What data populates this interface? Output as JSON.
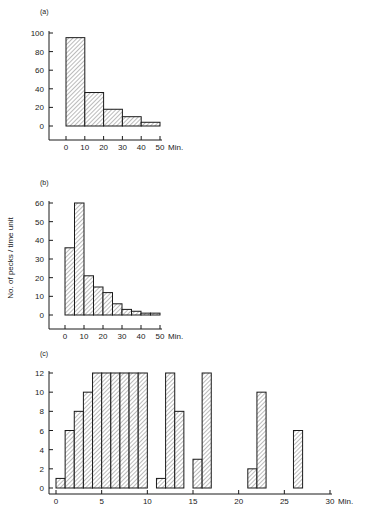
{
  "figure": {
    "shared_ylabel": "No. of pecks / time unit",
    "x_unit": "Min."
  },
  "chart_data": [
    {
      "panel": "(a)",
      "type": "bar",
      "bin_width": 10,
      "categories": [
        "0-10",
        "10-20",
        "20-30",
        "30-40",
        "40-50"
      ],
      "bin_starts": [
        0,
        10,
        20,
        30,
        40
      ],
      "values": [
        95,
        36,
        18,
        10,
        4
      ],
      "xticks": [
        "0",
        "10",
        "20",
        "30",
        "40",
        "50"
      ],
      "yticks": [
        "0",
        "20",
        "40",
        "60",
        "80",
        "100"
      ],
      "xlabel": "Min.",
      "ylabel": "",
      "xlim": [
        0,
        50
      ],
      "ylim": [
        0,
        100
      ],
      "grid": false
    },
    {
      "panel": "(b)",
      "type": "bar",
      "bin_width": 5,
      "categories": [
        "0-5",
        "5-10",
        "10-15",
        "15-20",
        "20-25",
        "25-30",
        "30-35",
        "35-40",
        "40-45",
        "45-50"
      ],
      "bin_starts": [
        0,
        5,
        10,
        15,
        20,
        25,
        30,
        35,
        40,
        45
      ],
      "values": [
        36,
        60,
        21,
        15,
        12,
        6,
        3,
        2,
        1,
        1
      ],
      "xticks": [
        "0",
        "10",
        "20",
        "30",
        "40",
        "50"
      ],
      "yticks": [
        "0",
        "10",
        "20",
        "30",
        "40",
        "50",
        "60"
      ],
      "xlabel": "Min.",
      "ylabel": "No. of pecks / time unit",
      "xlim": [
        0,
        50
      ],
      "ylim": [
        0,
        60
      ],
      "grid": false
    },
    {
      "panel": "(c)",
      "type": "bar",
      "bin_width": 1,
      "bin_starts": [
        0,
        1,
        2,
        3,
        4,
        5,
        6,
        7,
        8,
        9,
        11,
        12,
        13,
        15,
        16,
        21,
        22,
        26
      ],
      "values": [
        1,
        6,
        8,
        10,
        12,
        12,
        12,
        12,
        12,
        12,
        1,
        12,
        8,
        3,
        12,
        2,
        10,
        6
      ],
      "xticks": [
        "0",
        "5",
        "10",
        "15",
        "20",
        "25",
        "30"
      ],
      "yticks": [
        "0",
        "2",
        "4",
        "6",
        "8",
        "10",
        "12"
      ],
      "xlabel": "Min.",
      "ylabel": "",
      "xlim": [
        0,
        30
      ],
      "ylim": [
        0,
        12
      ],
      "grid": false
    }
  ]
}
